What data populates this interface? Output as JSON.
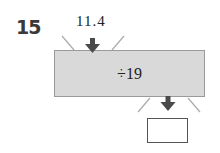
{
  "problem": {
    "number": "15",
    "input_value": "11.4",
    "operation": "÷19",
    "output_value": ""
  },
  "colors": {
    "machine_fill": "#d9d9d9",
    "machine_border": "#9a9a9a",
    "arrow": "#4a4a4a"
  }
}
